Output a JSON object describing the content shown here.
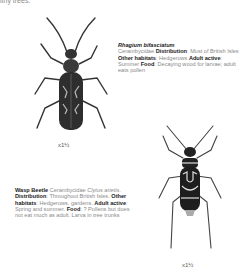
{
  "top_text": "lthy trees.",
  "species": [
    {
      "name": "Rhagium bifasciatum",
      "family": "Cerambycidae",
      "distribution_label": "Distribution",
      "distribution": "Most of British Isles",
      "habitats_label": "Other habitats",
      "habitats": "Hedgerows",
      "active_label": "Adult active",
      "active": "Summer",
      "food_label": "Food",
      "food": "Decaying wood for larvae; adult eats pollen",
      "scale": "x1½"
    },
    {
      "name": "Wasp Beetle",
      "family": "Cerambycidae",
      "latin": "Clytus arietis",
      "distribution_label": "Distribution",
      "distribution": "Throughout British Isles",
      "habitats_label": "Other habitats",
      "habitats": "Hedgerows, gardens",
      "active_label": "Adult active",
      "active": "Spring and summer",
      "food_label": "Food",
      "food": "? Pollens but does not eat much as adult. Larva in tree trunks",
      "scale": "x1½"
    }
  ]
}
